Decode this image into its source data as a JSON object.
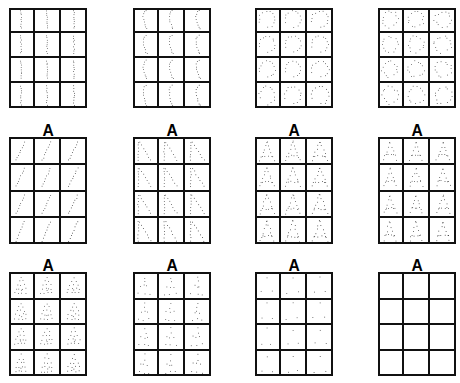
{
  "figure": {
    "kind": "dot-pattern-stimulus-sheet",
    "background_color": "#ffffff",
    "ink_color": "#111111",
    "panel_rows": 3,
    "panel_columns": 4,
    "cells_per_panel": 12,
    "cell_columns": 3,
    "cell_rows": 4
  },
  "panels": [
    {
      "id": "panel-1",
      "index": 1,
      "header": "",
      "has_header": false,
      "prototype": "I",
      "prototype_label": "vertical-bar",
      "distortion_level": "low",
      "dots_per_cell": 9,
      "empty": false
    },
    {
      "id": "panel-2",
      "index": 2,
      "header": "",
      "has_header": false,
      "prototype": "C",
      "prototype_label": "narrow-curve",
      "distortion_level": "low",
      "dots_per_cell": 9,
      "empty": false
    },
    {
      "id": "panel-3",
      "index": 3,
      "header": "",
      "has_header": false,
      "prototype": "C",
      "prototype_label": "open-circle",
      "distortion_level": "medium",
      "dots_per_cell": 12,
      "empty": false
    },
    {
      "id": "panel-4",
      "index": 4,
      "header": "",
      "has_header": false,
      "prototype": "C O S",
      "prototype_label": "mixed-curves",
      "distortion_level": "high",
      "dots_per_cell": 13,
      "empty": false
    },
    {
      "id": "panel-5",
      "index": 5,
      "header": "A",
      "has_header": true,
      "prototype": "/",
      "prototype_label": "diagonal-stroke",
      "distortion_level": "low",
      "dots_per_cell": 8,
      "empty": false
    },
    {
      "id": "panel-6",
      "index": 6,
      "header": "A",
      "has_header": true,
      "prototype": "N",
      "prototype_label": "double-diagonal",
      "distortion_level": "low",
      "dots_per_cell": 14,
      "empty": false
    },
    {
      "id": "panel-7",
      "index": 7,
      "header": "A",
      "has_header": true,
      "prototype": "A",
      "prototype_label": "apex-with-crossbar",
      "distortion_level": "medium",
      "dots_per_cell": 16,
      "empty": false
    },
    {
      "id": "panel-8",
      "index": 8,
      "header": "A",
      "has_header": true,
      "prototype": "A",
      "prototype_label": "compact-letter-a",
      "distortion_level": "medium",
      "dots_per_cell": 14,
      "empty": false
    },
    {
      "id": "panel-9",
      "index": 9,
      "header": "A",
      "has_header": true,
      "prototype": "A",
      "prototype_label": "filled-triangle-a",
      "distortion_level": "medium",
      "dots_per_cell": 15,
      "empty": false
    },
    {
      "id": "panel-10",
      "index": 10,
      "header": "A",
      "has_header": true,
      "prototype": "A",
      "prototype_label": "sparse-a",
      "distortion_level": "high",
      "dots_per_cell": 8,
      "empty": false
    },
    {
      "id": "panel-11",
      "index": 11,
      "header": "A",
      "has_header": true,
      "prototype": "A",
      "prototype_label": "three-point-a",
      "distortion_level": "extreme",
      "dots_per_cell": 3,
      "empty": false
    },
    {
      "id": "panel-12",
      "index": 12,
      "header": "A",
      "has_header": true,
      "prototype": "",
      "prototype_label": "blank",
      "distortion_level": "none",
      "dots_per_cell": 0,
      "empty": true
    }
  ]
}
